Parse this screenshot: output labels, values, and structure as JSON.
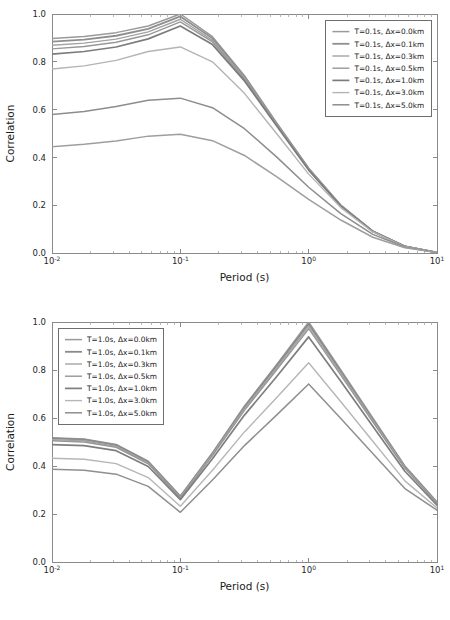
{
  "figure": {
    "background_color": "#ffffff",
    "axis_color": "#8a8a8a",
    "text_color": "#1a1a1a",
    "legend_border_color": "#6e6e6e"
  },
  "chart_data": [
    {
      "type": "line",
      "id": "top",
      "title": "",
      "xlabel": "Period (s)",
      "ylabel": "Correlation",
      "xscale": "log",
      "yscale": "linear",
      "xlim": [
        0.01,
        10.0
      ],
      "ylim": [
        0.0,
        1.0
      ],
      "grid": false,
      "legend_position": "upper right",
      "xtick_labels": [
        "10⁻²",
        "10⁻¹",
        "10⁰",
        "10¹"
      ],
      "xtick_bases": [
        "10",
        "10",
        "10",
        "10"
      ],
      "xtick_exponents": [
        "-2",
        "-1",
        "0",
        "1"
      ],
      "xtick_values": [
        0.01,
        0.1,
        1.0,
        10.0
      ],
      "ytick_labels": [
        "0.0",
        "0.2",
        "0.4",
        "0.6",
        "0.8",
        "1.0"
      ],
      "ytick_values": [
        0.0,
        0.2,
        0.4,
        0.6,
        0.8,
        1.0
      ],
      "x": [
        0.01,
        0.0178,
        0.0316,
        0.0562,
        0.1,
        0.178,
        0.316,
        0.562,
        1.0,
        1.78,
        3.16,
        5.62,
        10.0
      ],
      "series": [
        {
          "name": "T=0.1s, Δx=0.0km",
          "color": "#9a9a9a",
          "linewidth": 1.5,
          "values": [
            0.897,
            0.906,
            0.922,
            0.95,
            1.0,
            0.905,
            0.742,
            0.545,
            0.355,
            0.2,
            0.092,
            0.028,
            0.002
          ]
        },
        {
          "name": "T=0.1s, Δx=0.1km",
          "color": "#8e8e8e",
          "linewidth": 1.8,
          "values": [
            0.884,
            0.893,
            0.909,
            0.938,
            0.99,
            0.898,
            0.737,
            0.542,
            0.353,
            0.199,
            0.091,
            0.028,
            0.002
          ]
        },
        {
          "name": "T=0.1s, Δx=0.3km",
          "color": "#a2a2a2",
          "linewidth": 1.4,
          "values": [
            0.869,
            0.878,
            0.895,
            0.925,
            0.978,
            0.89,
            0.732,
            0.539,
            0.351,
            0.198,
            0.091,
            0.028,
            0.002
          ]
        },
        {
          "name": "T=0.1s, Δx=0.5km",
          "color": "#989898",
          "linewidth": 1.4,
          "values": [
            0.854,
            0.864,
            0.882,
            0.913,
            0.967,
            0.883,
            0.727,
            0.536,
            0.349,
            0.197,
            0.09,
            0.028,
            0.002
          ]
        },
        {
          "name": "T=0.1s, Δx=1.0km",
          "color": "#7c7c7c",
          "linewidth": 1.7,
          "values": [
            0.832,
            0.843,
            0.862,
            0.896,
            0.95,
            0.872,
            0.72,
            0.532,
            0.347,
            0.196,
            0.09,
            0.028,
            0.002
          ]
        },
        {
          "name": "T=0.1s, Δx=3.0km",
          "color": "#b4b4b4",
          "linewidth": 1.4,
          "values": [
            0.77,
            0.783,
            0.806,
            0.843,
            0.862,
            0.8,
            0.668,
            0.5,
            0.33,
            0.19,
            0.088,
            0.027,
            0.002
          ]
        },
        {
          "name": "T=0.1s, Δx=5.0km",
          "color": "#8d8d8d",
          "linewidth": 1.5,
          "values": [
            0.58,
            0.592,
            0.613,
            0.639,
            0.648,
            0.608,
            0.52,
            0.402,
            0.275,
            0.165,
            0.078,
            0.025,
            0.002
          ]
        },
        {
          "name": "T=0.1s extra",
          "color": "#9e9e9e",
          "linewidth": 1.5,
          "values": [
            0.445,
            0.455,
            0.469,
            0.489,
            0.497,
            0.47,
            0.408,
            0.32,
            0.224,
            0.138,
            0.066,
            0.022,
            0.002
          ]
        }
      ]
    },
    {
      "type": "line",
      "id": "bottom",
      "title": "",
      "xlabel": "Period (s)",
      "ylabel": "Correlation",
      "xscale": "log",
      "yscale": "linear",
      "xlim": [
        0.01,
        10.0
      ],
      "ylim": [
        0.0,
        1.0
      ],
      "grid": false,
      "legend_position": "upper left",
      "xtick_labels": [
        "10⁻²",
        "10⁻¹",
        "10⁰",
        "10¹"
      ],
      "xtick_bases": [
        "10",
        "10",
        "10",
        "10"
      ],
      "xtick_exponents": [
        "-2",
        "-1",
        "0",
        "1"
      ],
      "xtick_values": [
        0.01,
        0.1,
        1.0,
        10.0
      ],
      "ytick_labels": [
        "0.0",
        "0.2",
        "0.4",
        "0.6",
        "0.8",
        "1.0"
      ],
      "ytick_values": [
        0.0,
        0.2,
        0.4,
        0.6,
        0.8,
        1.0
      ],
      "x": [
        0.01,
        0.0178,
        0.0316,
        0.0562,
        0.1,
        0.178,
        0.316,
        0.562,
        1.0,
        1.78,
        3.16,
        5.62,
        10.0
      ],
      "series": [
        {
          "name": "T=1.0s, Δx=0.0km",
          "color": "#9a9a9a",
          "linewidth": 1.5,
          "values": [
            0.518,
            0.513,
            0.49,
            0.42,
            0.275,
            0.455,
            0.65,
            0.822,
            1.0,
            0.8,
            0.6,
            0.4,
            0.25
          ]
        },
        {
          "name": "T=1.0s, Δx=0.1km",
          "color": "#8a8a8a",
          "linewidth": 1.8,
          "values": [
            0.515,
            0.51,
            0.487,
            0.417,
            0.272,
            0.452,
            0.645,
            0.816,
            0.992,
            0.794,
            0.595,
            0.397,
            0.248
          ]
        },
        {
          "name": "T=1.0s, Δx=0.3km",
          "color": "#a4a4a4",
          "linewidth": 1.4,
          "values": [
            0.51,
            0.505,
            0.482,
            0.413,
            0.269,
            0.448,
            0.639,
            0.808,
            0.982,
            0.787,
            0.59,
            0.394,
            0.246
          ]
        },
        {
          "name": "T=1.0s, Δx=0.5km",
          "color": "#969696",
          "linewidth": 1.4,
          "values": [
            0.505,
            0.5,
            0.478,
            0.409,
            0.266,
            0.443,
            0.632,
            0.8,
            0.972,
            0.779,
            0.584,
            0.39,
            0.244
          ]
        },
        {
          "name": "T=1.0s, Δx=1.0km",
          "color": "#7e7e7e",
          "linewidth": 1.7,
          "values": [
            0.489,
            0.485,
            0.464,
            0.398,
            0.26,
            0.43,
            0.612,
            0.772,
            0.938,
            0.753,
            0.566,
            0.378,
            0.237
          ]
        },
        {
          "name": "T=1.0s, Δx=3.0km",
          "color": "#b6b6b6",
          "linewidth": 1.4,
          "values": [
            0.432,
            0.428,
            0.41,
            0.352,
            0.232,
            0.382,
            0.542,
            0.684,
            0.83,
            0.668,
            0.503,
            0.338,
            0.225
          ]
        },
        {
          "name": "T=1.0s, Δx=5.0km",
          "color": "#8f8f8f",
          "linewidth": 1.5,
          "values": [
            0.386,
            0.382,
            0.366,
            0.315,
            0.207,
            0.342,
            0.485,
            0.612,
            0.742,
            0.598,
            0.452,
            0.306,
            0.216
          ]
        }
      ]
    }
  ]
}
